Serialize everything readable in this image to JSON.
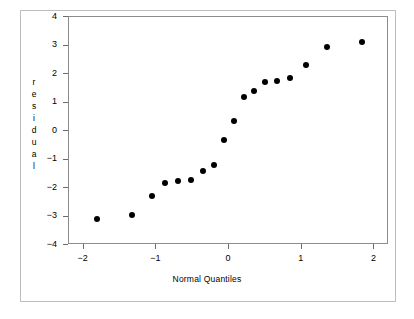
{
  "chart_data": {
    "type": "scatter",
    "title": "",
    "xlabel": "Normal Quantiles",
    "ylabel": "residual",
    "xlim": [
      -2.2,
      2.2
    ],
    "ylim": [
      -4,
      4
    ],
    "grid": false,
    "legend": null,
    "xticks": [
      -2,
      -1,
      0,
      1,
      2
    ],
    "xtick_labels": [
      "−2",
      "−1",
      "0",
      "1",
      "2"
    ],
    "yticks": [
      4,
      3,
      2,
      1,
      0,
      -1,
      -2,
      -3,
      -4
    ],
    "ytick_labels": [
      "4",
      "3",
      "2",
      "1",
      "0",
      "−1",
      "−2",
      "−3",
      "−4"
    ],
    "ylabel_chars": [
      "r",
      "e",
      "s",
      "i",
      "d",
      "u",
      "a",
      "l"
    ],
    "marker": "filled-circle",
    "marker_color": "#000000",
    "points": [
      {
        "x": -1.82,
        "y": -3.1
      },
      {
        "x": -1.34,
        "y": -2.95
      },
      {
        "x": -1.06,
        "y": -2.28
      },
      {
        "x": -0.88,
        "y": -1.84
      },
      {
        "x": -0.7,
        "y": -1.75
      },
      {
        "x": -0.52,
        "y": -1.71
      },
      {
        "x": -0.36,
        "y": -1.4
      },
      {
        "x": -0.21,
        "y": -1.2
      },
      {
        "x": -0.07,
        "y": -0.33
      },
      {
        "x": 0.07,
        "y": 0.35
      },
      {
        "x": 0.21,
        "y": 1.21
      },
      {
        "x": 0.35,
        "y": 1.41
      },
      {
        "x": 0.5,
        "y": 1.72
      },
      {
        "x": 0.66,
        "y": 1.76
      },
      {
        "x": 0.84,
        "y": 1.86
      },
      {
        "x": 1.06,
        "y": 2.31
      },
      {
        "x": 1.35,
        "y": 2.96
      },
      {
        "x": 1.83,
        "y": 3.11
      }
    ]
  }
}
